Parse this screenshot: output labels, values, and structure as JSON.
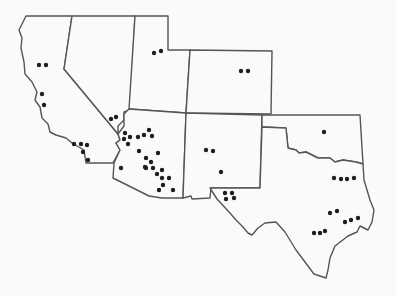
{
  "map": {
    "title": "",
    "background": "#fafafa",
    "stroke_color": "#555555",
    "dot_color": "#1e1e1e",
    "states": [
      {
        "name": "California",
        "path": "M26,16 L72,16 L64,69 L118,134 L120,140 L116,143 L120,150 L113,163 L86,163 L84,150 L72,143 L66,138 L56,135 L50,132 L48,124 L42,118 L40,107 L35,100 L37,92 L32,82 L25,74 L24,62 L21,48 L22,38 L19,30 L26,16 Z"
      },
      {
        "name": "Nevada",
        "path": "M72,16 L135,16 L130,110 L124,112 L124,120 L118,126 L118,134 L64,69 Z"
      },
      {
        "name": "Utah",
        "path": "M135,16 L168,16 L168,50 L190,50 L186,113 L129,109 Z"
      },
      {
        "name": "Colorado",
        "path": "M190,50 L272,51 L271,114 L186,113 Z"
      },
      {
        "name": "Arizona",
        "path": "M129,109 L186,113 L183,198 L162,198 L149,196 L113,178 L114,163 L120,150 L116,143 L120,140 L118,134 L124,126 L124,114 Z"
      },
      {
        "name": "New Mexico",
        "path": "M186,113 L262,115 L260,188 L211,188 L210,198 L192,199 L191,196 L183,198 Z"
      },
      {
        "name": "Oklahoma",
        "path": "M262,115 L360,115 L363,164 L356,162 L343,160 L335,162 L330,158 L318,158 L306,152 L299,153 L296,150 L288,148 L286,128 L262,127 Z"
      },
      {
        "name": "Texas",
        "path": "M262,127 L286,128 L288,148 L296,150 L299,153 L306,152 L318,158 L330,158 L335,162 L343,160 L356,162 L363,164 L364,180 L370,200 L374,210 L372,222 L368,230 L360,226 L357,232 L348,236 L335,246 L330,258 L328,270 L326,278 L320,276 L314,274 L305,262 L296,250 L285,232 L276,222 L265,223 L258,228 L252,235 L248,233 L242,226 L236,220 L230,213 L217,199 L210,188 L260,188 Z"
      }
    ],
    "dots": [
      {
        "x": 39,
        "y": 65
      },
      {
        "x": 46,
        "y": 65
      },
      {
        "x": 42,
        "y": 94
      },
      {
        "x": 44,
        "y": 105
      },
      {
        "x": 154,
        "y": 53
      },
      {
        "x": 161,
        "y": 51
      },
      {
        "x": 241,
        "y": 71
      },
      {
        "x": 248,
        "y": 71
      },
      {
        "x": 111,
        "y": 119
      },
      {
        "x": 116,
        "y": 117
      },
      {
        "x": 74,
        "y": 144
      },
      {
        "x": 81,
        "y": 144
      },
      {
        "x": 87,
        "y": 145
      },
      {
        "x": 83,
        "y": 152
      },
      {
        "x": 88,
        "y": 160
      },
      {
        "x": 125,
        "y": 133
      },
      {
        "x": 124,
        "y": 139
      },
      {
        "x": 130,
        "y": 137
      },
      {
        "x": 138,
        "y": 137
      },
      {
        "x": 144,
        "y": 135
      },
      {
        "x": 149,
        "y": 130
      },
      {
        "x": 152,
        "y": 136
      },
      {
        "x": 128,
        "y": 144
      },
      {
        "x": 139,
        "y": 151
      },
      {
        "x": 121,
        "y": 168
      },
      {
        "x": 146,
        "y": 158
      },
      {
        "x": 158,
        "y": 153
      },
      {
        "x": 145,
        "y": 167
      },
      {
        "x": 151,
        "y": 162
      },
      {
        "x": 146,
        "y": 168
      },
      {
        "x": 153,
        "y": 168
      },
      {
        "x": 157,
        "y": 174
      },
      {
        "x": 162,
        "y": 170
      },
      {
        "x": 162,
        "y": 178
      },
      {
        "x": 169,
        "y": 178
      },
      {
        "x": 163,
        "y": 185
      },
      {
        "x": 159,
        "y": 190
      },
      {
        "x": 173,
        "y": 190
      },
      {
        "x": 206,
        "y": 150
      },
      {
        "x": 213,
        "y": 151
      },
      {
        "x": 221,
        "y": 172
      },
      {
        "x": 225,
        "y": 193
      },
      {
        "x": 232,
        "y": 193
      },
      {
        "x": 226,
        "y": 199
      },
      {
        "x": 234,
        "y": 198
      },
      {
        "x": 324,
        "y": 132
      },
      {
        "x": 334,
        "y": 178
      },
      {
        "x": 341,
        "y": 179
      },
      {
        "x": 347,
        "y": 179
      },
      {
        "x": 354,
        "y": 178
      },
      {
        "x": 330,
        "y": 213
      },
      {
        "x": 337,
        "y": 211
      },
      {
        "x": 345,
        "y": 222
      },
      {
        "x": 351,
        "y": 220
      },
      {
        "x": 358,
        "y": 218
      },
      {
        "x": 314,
        "y": 233
      },
      {
        "x": 320,
        "y": 233
      },
      {
        "x": 325,
        "y": 231
      }
    ]
  }
}
